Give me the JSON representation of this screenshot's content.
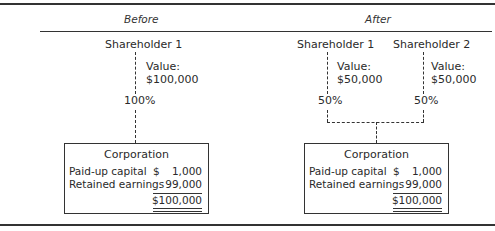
{
  "diagram": {
    "before": {
      "header": "Before",
      "shareholders": [
        {
          "name": "Shareholder 1",
          "value_label": "Value:",
          "value": "$100,000",
          "ownership": "100%"
        }
      ],
      "corporation": {
        "title": "Corporation",
        "rows": [
          {
            "label": "Paid-up capital",
            "currency": "$",
            "amount": "1,000"
          },
          {
            "label": "Retained earnings",
            "currency": "",
            "amount": "99,000"
          }
        ],
        "total": "$100,000"
      }
    },
    "after": {
      "header": "After",
      "shareholders": [
        {
          "name": "Shareholder 1",
          "value_label": "Value:",
          "value": "$50,000",
          "ownership": "50%"
        },
        {
          "name": "Shareholder 2",
          "value_label": "Value:",
          "value": "$50,000",
          "ownership": "50%"
        }
      ],
      "corporation": {
        "title": "Corporation",
        "rows": [
          {
            "label": "Paid-up capital",
            "currency": "$",
            "amount": "1,000"
          },
          {
            "label": "Retained earnings",
            "currency": "",
            "amount": "99,000"
          }
        ],
        "total": "$100,000"
      }
    }
  }
}
